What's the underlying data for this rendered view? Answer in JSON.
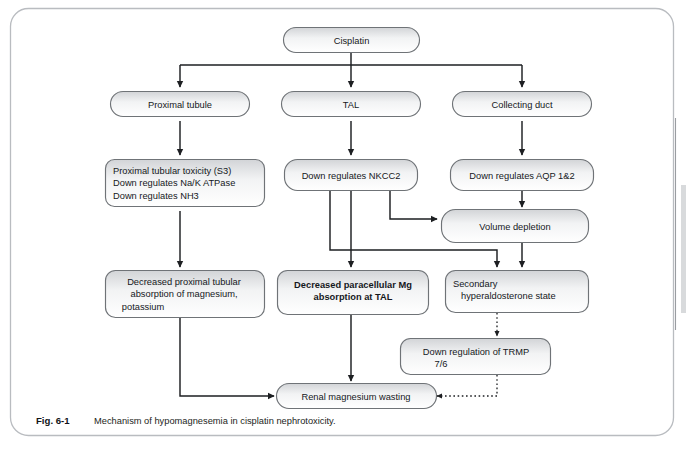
{
  "figure": {
    "caption_label": "Fig. 6-1",
    "caption_text": "Mechanism of hypomagnesemia in cisplatin nephrotoxicity.",
    "frame_color": "#b9bcc0",
    "node_border_color": "#6f7377",
    "node_fill_top": "#d2d4d7",
    "node_fill_bottom": "#ffffff",
    "connector_color": "#1d1f22",
    "text_color": "#15181c"
  },
  "nodes": {
    "cisplatin": {
      "lines": [
        "Cisplatin"
      ],
      "align": "center",
      "bold": false
    },
    "proximal_tubule": {
      "lines": [
        "Proximal tubule"
      ],
      "align": "center",
      "bold": false
    },
    "tal": {
      "lines": [
        "TAL"
      ],
      "align": "center",
      "bold": false
    },
    "collecting_duct": {
      "lines": [
        "Collecting duct"
      ],
      "align": "center",
      "bold": false
    },
    "proximal_toxicity": {
      "lines": [
        "Proximal tubular toxicity (S3)",
        "Down regulates Na/K ATPase",
        "Down regulates NH3"
      ],
      "align": "left",
      "bold": false
    },
    "nkcc2": {
      "lines": [
        "Down regulates NKCC2"
      ],
      "align": "center",
      "bold": false
    },
    "aqp": {
      "lines": [
        "Down regulates AQP 1&2"
      ],
      "align": "center",
      "bold": false
    },
    "volume_depletion": {
      "lines": [
        "Volume depletion"
      ],
      "align": "center",
      "bold": false
    },
    "decreased_proximal_absorption": {
      "lines": [
        "Decreased proximal tubular",
        "absorption of magnesium,",
        "potassium"
      ],
      "align": "center",
      "bold": false
    },
    "decreased_paracellular_mg": {
      "lines": [
        "Decreased paracellular Mg",
        "absorption at TAL"
      ],
      "align": "center",
      "bold": true
    },
    "secondary_hyperaldosterone": {
      "lines": [
        "Secondary",
        "hyperaldosterone state"
      ],
      "align": "left-indent",
      "bold": false
    },
    "trmp": {
      "lines": [
        "Down regulation of TRMP",
        "7/6"
      ],
      "align": "center",
      "bold": false
    },
    "renal_magnesium_wasting": {
      "lines": [
        "Renal magnesium wasting"
      ],
      "align": "center",
      "bold": false
    }
  }
}
